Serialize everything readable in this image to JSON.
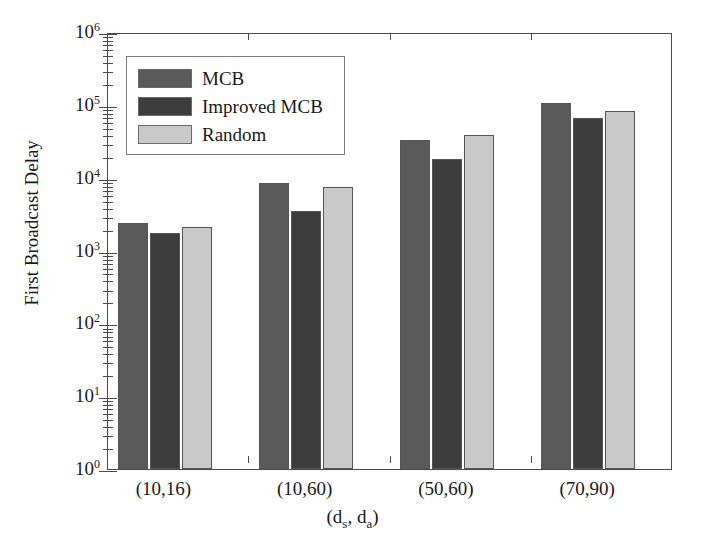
{
  "chart_data": {
    "type": "bar",
    "title": "",
    "xlabel": "(d_s, d_a)",
    "ylabel": "First Broadcast Delay",
    "yscale": "log",
    "ylim": [
      1,
      1000000
    ],
    "grid": false,
    "legend_position": "upper-left",
    "categories": [
      "(10,16)",
      "(10,60)",
      "(50,60)",
      "(70,90)"
    ],
    "series": [
      {
        "name": "MCB",
        "color": "#5a5a5a",
        "values": [
          2400,
          8500,
          33000,
          105000
        ]
      },
      {
        "name": "Improved MCB",
        "color": "#3d3d3d",
        "values": [
          1750,
          3500,
          18000,
          65000
        ]
      },
      {
        "name": "Random",
        "color": "#c9c9c9",
        "values": [
          2100,
          7400,
          39000,
          82000
        ]
      }
    ],
    "ytick_labels": [
      {
        "base": "10",
        "exp": "0"
      },
      {
        "base": "10",
        "exp": "1"
      },
      {
        "base": "10",
        "exp": "2"
      },
      {
        "base": "10",
        "exp": "3"
      },
      {
        "base": "10",
        "exp": "4"
      },
      {
        "base": "10",
        "exp": "5"
      },
      {
        "base": "10",
        "exp": "6"
      }
    ]
  },
  "axes": {
    "y_title": "First Broadcast Delay",
    "x_title_prefix": "(d",
    "x_title_sub1": "s",
    "x_title_mid": ", d",
    "x_title_sub2": "a",
    "x_title_suffix": ")"
  },
  "legend": {
    "items": [
      {
        "label": "MCB",
        "color": "#5a5a5a"
      },
      {
        "label": "Improved MCB",
        "color": "#3d3d3d"
      },
      {
        "label": "Random",
        "color": "#c9c9c9"
      }
    ]
  },
  "colors": {
    "axis": "#4a4a4a",
    "background": "#ffffff",
    "text": "#1a1a1a"
  }
}
